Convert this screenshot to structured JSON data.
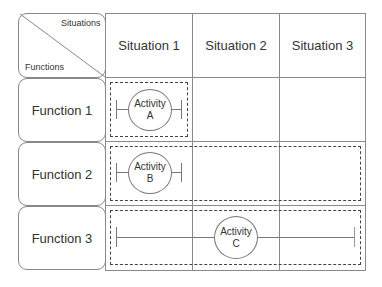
{
  "corner": {
    "top_label": "Situations",
    "bottom_label": "Functions"
  },
  "columns": [
    {
      "label": "Situation 1"
    },
    {
      "label": "Situation 2"
    },
    {
      "label": "Situation 3"
    }
  ],
  "rows": [
    {
      "label": "Function 1"
    },
    {
      "label": "Function 2"
    },
    {
      "label": "Function 3"
    }
  ],
  "activities": [
    {
      "line1": "Activity",
      "line2": "A",
      "row": 1,
      "span": "Situation 1"
    },
    {
      "line1": "Activity",
      "line2": "B",
      "row": 2,
      "span": "Situation 1 - Situation 3"
    },
    {
      "line1": "Activity",
      "line2": "C",
      "row": 3,
      "span": "Situation 1 - Situation 3"
    }
  ]
}
